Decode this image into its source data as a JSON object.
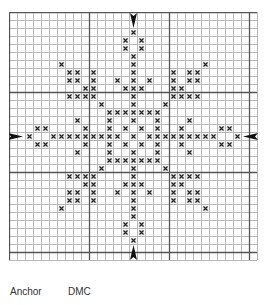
{
  "pattern": {
    "cols": 31,
    "rows": 31,
    "cell_px": 8,
    "major_every": 10,
    "colors": {
      "minor_line": "#b8b8b8",
      "major_line": "#555555",
      "border": "#666666",
      "stitch": "#222222",
      "arrow": "#111111"
    },
    "stitch_symbol": "×",
    "center_arrows": [
      {
        "position": "top",
        "col": 15,
        "points": "down"
      },
      {
        "position": "bottom",
        "col": 15,
        "points": "up"
      },
      {
        "position": "left",
        "row": 15,
        "points": "right"
      },
      {
        "position": "right",
        "row": 15,
        "points": "left"
      }
    ],
    "stitches": {
      "2": [
        15
      ],
      "3": [
        14,
        16
      ],
      "4": [
        14,
        16
      ],
      "5": [
        15
      ],
      "6": [
        6,
        15,
        24
      ],
      "7": [
        7,
        8,
        10,
        15,
        20,
        22,
        23
      ],
      "8": [
        7,
        8,
        10,
        13,
        15,
        17,
        20,
        22,
        23
      ],
      "9": [
        9,
        10,
        14,
        15,
        16,
        20,
        21
      ],
      "10": [
        7,
        8,
        9,
        10,
        15,
        20,
        21,
        22,
        23
      ],
      "11": [
        11,
        15,
        19
      ],
      "12": [
        12,
        13,
        14,
        15,
        16,
        17,
        18
      ],
      "13": [
        8,
        12,
        15,
        18,
        22
      ],
      "14": [
        3,
        4,
        9,
        12,
        14,
        16,
        18,
        21,
        26,
        27
      ],
      "15": [
        2,
        5,
        6,
        7,
        8,
        9,
        10,
        11,
        12,
        13,
        15,
        17,
        18,
        19,
        20,
        21,
        22,
        23,
        24,
        25,
        28
      ],
      "16": [
        3,
        4,
        9,
        12,
        14,
        16,
        18,
        21,
        26,
        27
      ],
      "17": [
        8,
        12,
        15,
        18,
        22
      ],
      "18": [
        12,
        13,
        14,
        15,
        16,
        17,
        18
      ],
      "19": [
        11,
        15,
        19
      ],
      "20": [
        7,
        8,
        9,
        10,
        15,
        20,
        21,
        22,
        23
      ],
      "21": [
        9,
        10,
        14,
        15,
        16,
        20,
        21
      ],
      "22": [
        7,
        8,
        10,
        13,
        15,
        17,
        20,
        22,
        23
      ],
      "23": [
        7,
        8,
        10,
        15,
        20,
        22,
        23
      ],
      "24": [
        6,
        15,
        24
      ],
      "25": [
        15
      ],
      "26": [
        14,
        16
      ],
      "27": [
        14,
        16
      ],
      "28": [
        15
      ]
    }
  },
  "legend": {
    "col1": "Anchor",
    "col2": "DMC"
  }
}
